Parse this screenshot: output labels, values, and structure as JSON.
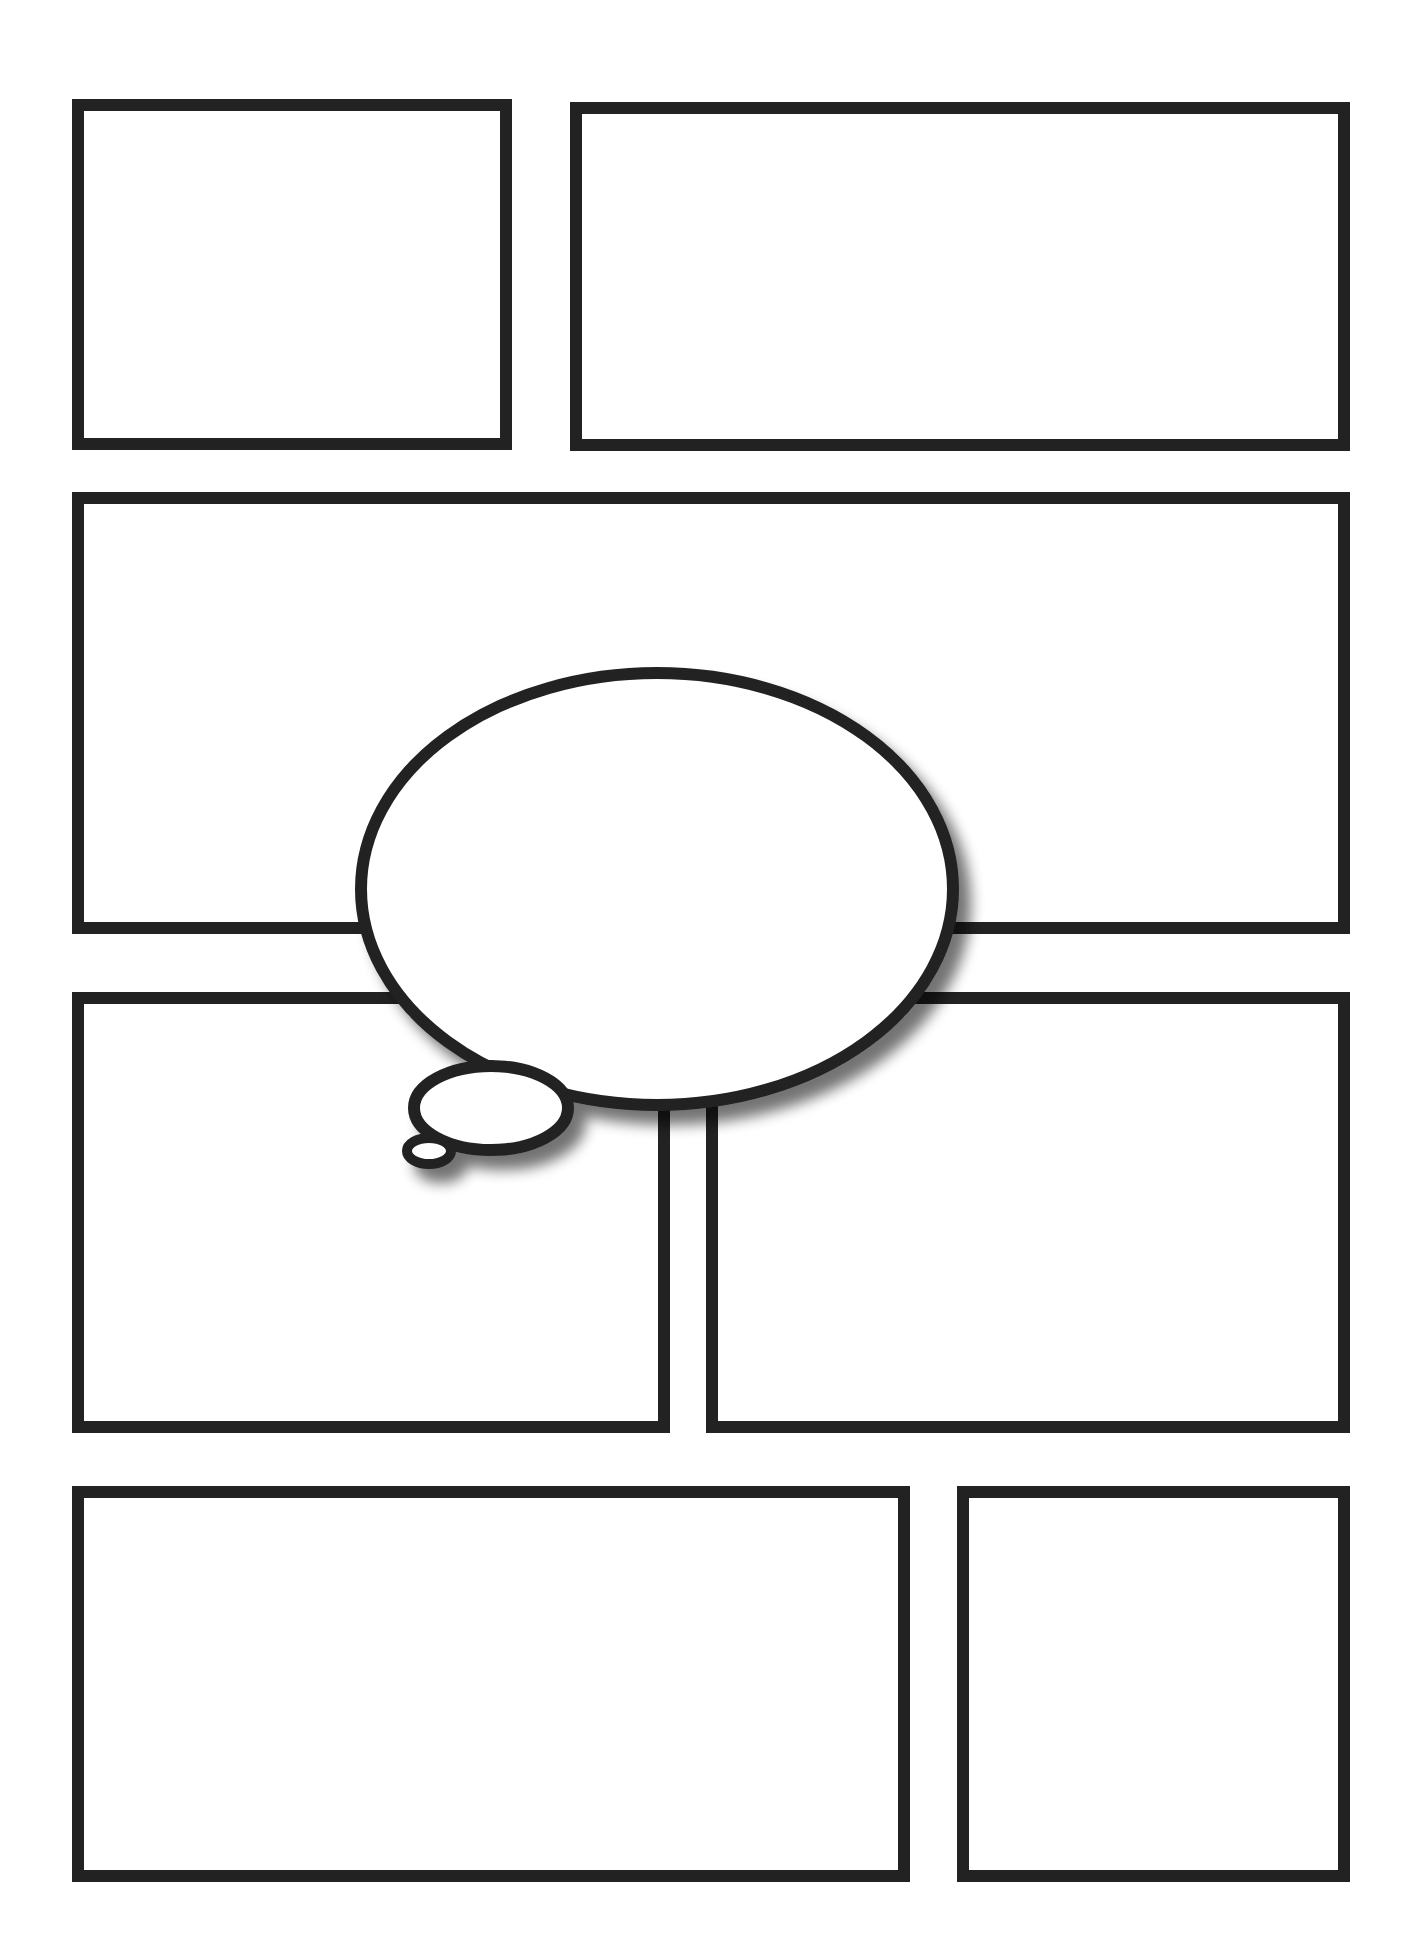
{
  "page": {
    "title": "Blank comic page template",
    "background_color": "#ffffff",
    "stroke_color": "#222222",
    "border_width_px": 12
  },
  "panels": [
    {
      "id": "panel-1",
      "row": 1,
      "x": 72,
      "y": 99,
      "w": 440,
      "h": 351
    },
    {
      "id": "panel-2",
      "row": 1,
      "x": 570,
      "y": 102,
      "w": 780,
      "h": 349
    },
    {
      "id": "panel-3",
      "row": 2,
      "x": 72,
      "y": 492,
      "w": 1278,
      "h": 442
    },
    {
      "id": "panel-4",
      "row": 3,
      "x": 72,
      "y": 992,
      "w": 598,
      "h": 441
    },
    {
      "id": "panel-5",
      "row": 3,
      "x": 706,
      "y": 992,
      "w": 644,
      "h": 441
    },
    {
      "id": "panel-6",
      "row": 4,
      "x": 72,
      "y": 1486,
      "w": 838,
      "h": 396
    },
    {
      "id": "panel-7",
      "row": 4,
      "x": 957,
      "y": 1486,
      "w": 393,
      "h": 396
    }
  ],
  "thought_bubble": {
    "text": "",
    "main": {
      "cx": 657,
      "cy": 889,
      "rx": 296,
      "ry": 216
    },
    "medium": {
      "cx": 491,
      "cy": 1108,
      "rx": 77,
      "ry": 42
    },
    "small": {
      "cx": 429,
      "cy": 1151,
      "rx": 22,
      "ry": 13
    },
    "stroke_width": 12,
    "shadow_color": "#888888"
  }
}
